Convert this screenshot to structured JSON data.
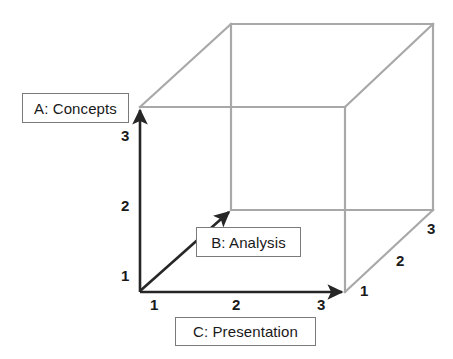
{
  "diagram": {
    "type": "3d-axes-cube",
    "colors": {
      "cube_line": "#a8a8a8",
      "axis_line": "#262626",
      "box_border": "#7a7a7a",
      "text": "#1a1a1a",
      "background": "#ffffff"
    },
    "axes": [
      {
        "id": "a",
        "label": "A: Concepts",
        "orientation": "vertical",
        "ticks": [
          "1",
          "2",
          "3"
        ]
      },
      {
        "id": "b",
        "label": "B: Analysis",
        "orientation": "depth-diagonal",
        "ticks": [
          "1",
          "2",
          "3"
        ]
      },
      {
        "id": "c",
        "label": "C: Presentation",
        "orientation": "horizontal",
        "ticks": [
          "1",
          "2",
          "3"
        ]
      }
    ],
    "ticks": {
      "vertical": [
        {
          "value": "1",
          "x": 121,
          "y": 268
        },
        {
          "value": "2",
          "x": 121,
          "y": 198
        },
        {
          "value": "3",
          "x": 121,
          "y": 128
        }
      ],
      "horizontal": [
        {
          "value": "1",
          "x": 150,
          "y": 297
        },
        {
          "value": "2",
          "x": 232,
          "y": 297
        },
        {
          "value": "3",
          "x": 317,
          "y": 297
        }
      ],
      "depth": [
        {
          "value": "1",
          "x": 360,
          "y": 283
        },
        {
          "value": "2",
          "x": 396,
          "y": 253
        },
        {
          "value": "3",
          "x": 427,
          "y": 221
        }
      ]
    }
  }
}
